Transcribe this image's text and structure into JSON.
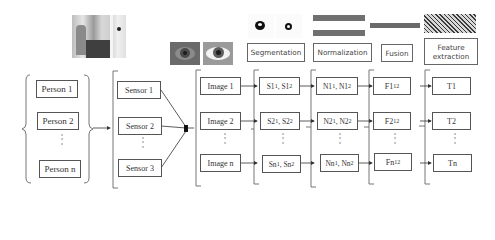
{
  "diagram": {
    "persons": [
      "Person 1",
      "Person 2",
      "Person n"
    ],
    "sensors": [
      "Sensor 1",
      "Sensor 2",
      "Sensor 3"
    ],
    "images": [
      "Image 1",
      "Image 2",
      "Image n"
    ],
    "segmentation": {
      "label": "Segmentation",
      "rows": [
        {
          "a": "S1",
          "a_sub": "1",
          "b": "S1",
          "b_sub": "2"
        },
        {
          "a": "S2",
          "a_sub": "1",
          "b": "S2",
          "b_sub": "2"
        },
        {
          "a": "Sn",
          "a_sub": "1",
          "b": "Sn",
          "b_sub": "2"
        }
      ]
    },
    "normalization": {
      "label": "Normalization",
      "rows": [
        {
          "a": "N1",
          "a_sub": "1",
          "b": "N1",
          "b_sub": "2"
        },
        {
          "a": "N2",
          "a_sub": "1",
          "b": "N2",
          "b_sub": "2"
        },
        {
          "a": "Nn",
          "a_sub": "1",
          "b": "Nn",
          "b_sub": "2"
        }
      ]
    },
    "fusion": {
      "label": "Fusion",
      "rows": [
        {
          "a": "F1",
          "a_sub": "12"
        },
        {
          "a": "F2",
          "a_sub": "12"
        },
        {
          "a": "Fn",
          "a_sub": "12"
        }
      ]
    },
    "feature_extraction": {
      "label_line1": "Feature",
      "label_line2": "extraction",
      "rows": [
        "T1",
        "T2",
        "Tn"
      ]
    },
    "ellipsis": "⋮",
    "colors": {
      "line": "#444444",
      "box_border": "#555555",
      "eye_dark": "#5a5a5a",
      "strip": "#6e6e6e"
    }
  }
}
